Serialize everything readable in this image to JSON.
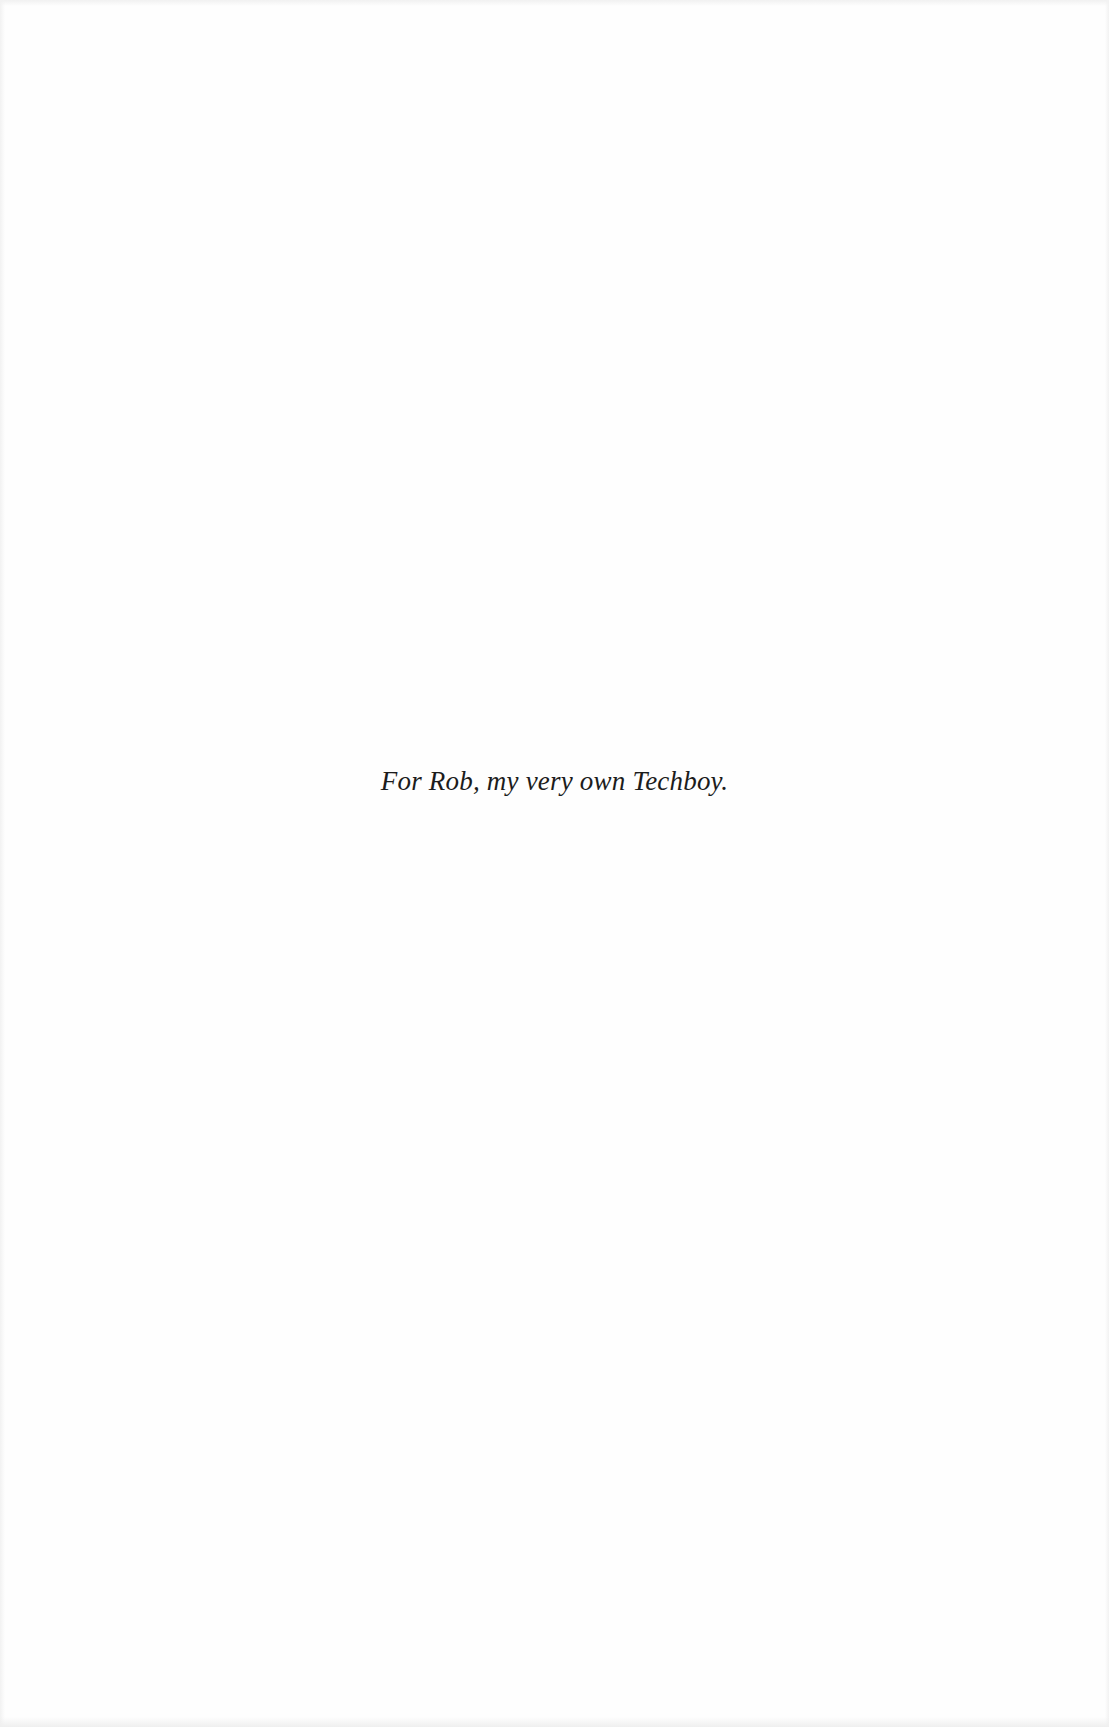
{
  "page": {
    "type": "dedication",
    "dedication_text": "For Rob, my very own Techboy."
  },
  "colors": {
    "background": "#fefefe",
    "text": "#1c1c1c"
  }
}
